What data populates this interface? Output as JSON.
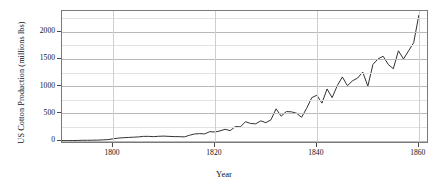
{
  "chart_data": {
    "type": "line",
    "title": "",
    "xlabel": "Year",
    "ylabel": "US Cotton Production (millions lbs)",
    "xlim": [
      1790,
      1862
    ],
    "ylim": [
      -60,
      2380
    ],
    "xticks": [
      1800,
      1820,
      1840,
      1860
    ],
    "xticklabels": [
      "1800",
      "1820",
      "1840",
      "1860"
    ],
    "yticks": [
      0,
      500,
      1000,
      1500,
      2000
    ],
    "yticklabels": [
      "0",
      "500",
      "1000",
      "1500",
      "2000"
    ],
    "yminorticks": [
      250,
      750,
      1250,
      1750,
      2250
    ],
    "grid": "horizontal-major-minor, vertical-at-xticks",
    "legend": "none",
    "line_color": "#333333",
    "line_width": 1,
    "series": [
      {
        "name": "US Cotton Production",
        "x": [
          1790,
          1791,
          1792,
          1793,
          1794,
          1795,
          1796,
          1797,
          1798,
          1799,
          1800,
          1801,
          1802,
          1803,
          1804,
          1805,
          1806,
          1807,
          1808,
          1809,
          1810,
          1811,
          1812,
          1813,
          1814,
          1815,
          1816,
          1817,
          1818,
          1819,
          1820,
          1821,
          1822,
          1823,
          1824,
          1825,
          1826,
          1827,
          1828,
          1829,
          1830,
          1831,
          1832,
          1833,
          1834,
          1835,
          1836,
          1837,
          1838,
          1839,
          1840,
          1841,
          1842,
          1843,
          1844,
          1845,
          1846,
          1847,
          1848,
          1849,
          1850,
          1851,
          1852,
          1853,
          1854,
          1855,
          1856,
          1857,
          1858,
          1859,
          1860
        ],
        "values": [
          2,
          2,
          3,
          5,
          8,
          8,
          10,
          11,
          16,
          20,
          35,
          48,
          55,
          60,
          65,
          70,
          80,
          80,
          75,
          82,
          85,
          80,
          75,
          75,
          70,
          100,
          124,
          130,
          125,
          167,
          160,
          180,
          210,
          185,
          260,
          255,
          350,
          316,
          310,
          365,
          331,
          385,
          585,
          450,
          535,
          530,
          505,
          430,
          595,
          790,
          835,
          690,
          950,
          790,
          1010,
          1170,
          1010,
          1100,
          1150,
          1260,
          1000,
          1400,
          1500,
          1550,
          1400,
          1320,
          1650,
          1500,
          1650,
          1800,
          2300
        ]
      }
    ]
  },
  "axis": {
    "xtick_labels": [
      "1800",
      "1820",
      "1840",
      "1860"
    ],
    "ytick_labels": [
      "0",
      "500",
      "1000",
      "1500",
      "2000"
    ],
    "x_title": "Year",
    "y_title": "US Cotton Production (millions lbs)"
  }
}
